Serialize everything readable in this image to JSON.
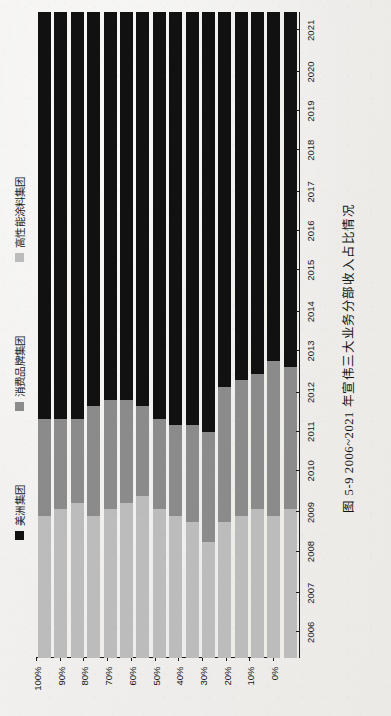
{
  "figure": {
    "caption_number": "图 5-9",
    "caption_text": "2006~2021 年宣伟三大业务分部收入占比情况",
    "caption_full": "图 5-9  2006~2021 年宣伟三大业务分部收入占比情况"
  },
  "legend": {
    "items": [
      {
        "label": "美洲集团",
        "color": "#111111",
        "swatch_name": "legend-swatch-americas"
      },
      {
        "label": "消费品牌集团",
        "color": "#8b8b8b",
        "swatch_name": "legend-swatch-consumer"
      },
      {
        "label": "高性能涂料集团",
        "color": "#bcbcbc",
        "swatch_name": "legend-swatch-performance"
      }
    ]
  },
  "axis": {
    "value_ticks": [
      "0%",
      "10%",
      "20%",
      "30%",
      "40%",
      "50%",
      "60%",
      "70%",
      "80%",
      "90%",
      "100%"
    ],
    "value_min": 0,
    "value_max": 100
  },
  "chart_data": {
    "type": "bar",
    "orientation": "horizontal-stacked",
    "stacked": true,
    "normalized": true,
    "title": "图 5-9  2006~2021 年宣伟三大业务分部收入占比情况",
    "xlabel": "",
    "ylabel": "",
    "xlim": [
      0,
      100
    ],
    "grid": false,
    "legend_position": "top",
    "categories": [
      "2006",
      "2007",
      "2008",
      "2009",
      "2010",
      "2011",
      "2012",
      "2013",
      "2014",
      "2015",
      "2016",
      "2017",
      "2018",
      "2019",
      "2020",
      "2021"
    ],
    "series": [
      {
        "name": "美洲集团",
        "color": "#111111",
        "values": [
          63,
          63,
          63,
          61,
          60,
          60,
          61,
          63,
          64,
          64,
          65,
          58,
          57,
          56,
          54,
          55
        ]
      },
      {
        "name": "消费品牌集团",
        "color": "#8b8b8b",
        "values": [
          15,
          14,
          13,
          17,
          17,
          16,
          14,
          14,
          14,
          15,
          17,
          21,
          21,
          21,
          24,
          22
        ]
      },
      {
        "name": "高性能涂料集团",
        "color": "#bcbcbc",
        "values": [
          22,
          23,
          24,
          22,
          23,
          24,
          25,
          23,
          22,
          21,
          18,
          21,
          22,
          23,
          22,
          23
        ]
      }
    ]
  }
}
